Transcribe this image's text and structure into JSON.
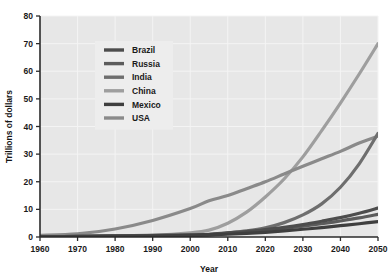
{
  "chart_data": {
    "type": "line",
    "title": "",
    "xlabel": "Year",
    "ylabel": "Trillions of dollars",
    "xlim": [
      1960,
      2050
    ],
    "ylim": [
      0,
      80
    ],
    "xticks": [
      1960,
      1970,
      1980,
      1990,
      2000,
      2010,
      2020,
      2030,
      2040,
      2050
    ],
    "yticks": [
      0,
      10,
      20,
      30,
      40,
      50,
      60,
      70,
      80
    ],
    "grid": true,
    "legend_position": "upper-left-inside",
    "x": [
      1960,
      1970,
      1980,
      1990,
      2000,
      2005,
      2010,
      2015,
      2020,
      2025,
      2030,
      2035,
      2040,
      2045,
      2050
    ],
    "series": [
      {
        "name": "Brazil",
        "color": "#4d4d4d",
        "values": [
          0.1,
          0.2,
          0.4,
          0.6,
          0.8,
          1.0,
          1.5,
          2.0,
          2.7,
          3.5,
          4.5,
          5.7,
          7.0,
          8.6,
          10.5
        ]
      },
      {
        "name": "Russia",
        "color": "#5c5c5c",
        "values": [
          0.1,
          0.2,
          0.3,
          0.5,
          0.4,
          0.8,
          1.3,
          1.8,
          2.4,
          3.1,
          3.9,
          4.8,
          5.8,
          6.9,
          8.2
        ]
      },
      {
        "name": "India",
        "color": "#6e6e6e",
        "values": [
          0.1,
          0.2,
          0.3,
          0.4,
          0.6,
          0.9,
          1.5,
          2.2,
          3.3,
          5.2,
          8.0,
          12.0,
          18.0,
          26.5,
          37.5
        ]
      },
      {
        "name": "China",
        "color": "#9e9e9e",
        "values": [
          0.1,
          0.2,
          0.4,
          0.6,
          1.5,
          2.5,
          5.0,
          9.0,
          14.5,
          21.0,
          29.0,
          38.5,
          48.5,
          59.0,
          70.0
        ]
      },
      {
        "name": "Mexico",
        "color": "#3f3f3f",
        "values": [
          0.05,
          0.1,
          0.2,
          0.3,
          0.6,
          0.8,
          1.0,
          1.3,
          1.7,
          2.2,
          2.8,
          3.4,
          4.1,
          4.8,
          5.6
        ]
      },
      {
        "name": "USA",
        "color": "#8a8a8a",
        "values": [
          0.6,
          1.1,
          2.9,
          6.0,
          10.3,
          13.1,
          15.0,
          17.5,
          20.0,
          22.8,
          25.6,
          28.3,
          31.0,
          34.0,
          36.5
        ]
      }
    ]
  },
  "legend": {
    "entries": [
      {
        "label": "Brazil"
      },
      {
        "label": "Russia"
      },
      {
        "label": "India"
      },
      {
        "label": "China"
      },
      {
        "label": "Mexico"
      },
      {
        "label": "USA"
      }
    ]
  },
  "style": {
    "plot_background": "#e7e7e7",
    "page_background": "#ffffff",
    "grid_color": "#f4f4f4",
    "axis_color": "#2b2b2b",
    "legend_background": "#ededed"
  }
}
